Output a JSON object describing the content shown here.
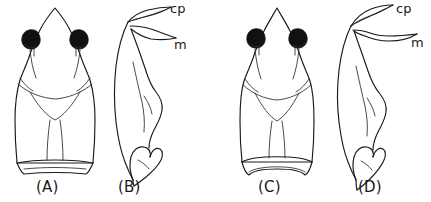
{
  "figure": {
    "type": "scientific-line-drawing-plate",
    "background_color": "#ffffff",
    "ink_color": "#1a1a1a",
    "eye_color": "#111111",
    "panel_count": 4
  },
  "panels": [
    {
      "id": "A",
      "label": "(A)",
      "view": "dorsal",
      "features": [
        "pointed-snout",
        "paired-black-eyes",
        "body-outline",
        "ventral-fold",
        "straight-posterior-margin"
      ]
    },
    {
      "id": "B",
      "label": "(B)",
      "view": "lateral-appendage",
      "features": [
        "curved-shaft",
        "cp-process",
        "m-process",
        "distal-claw"
      ]
    },
    {
      "id": "C",
      "label": "(C)",
      "view": "dorsal",
      "features": [
        "pointed-snout",
        "paired-black-eyes",
        "body-outline",
        "ventral-fold",
        "concave-posterior-margin"
      ]
    },
    {
      "id": "D",
      "label": "(D)",
      "view": "lateral-appendage",
      "features": [
        "curved-shaft",
        "cp-process",
        "elongate-m-process",
        "distal-claw"
      ]
    }
  ],
  "annotations": {
    "panel_b": {
      "cp": "cp",
      "m": "m"
    },
    "panel_d": {
      "cp": "cp",
      "m": "m"
    }
  }
}
